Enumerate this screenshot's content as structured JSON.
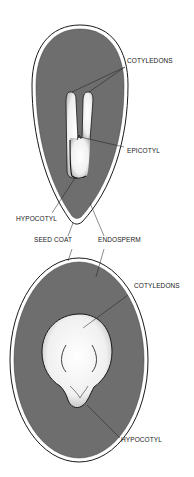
{
  "diagram": {
    "colors": {
      "endosperm": "#6e6e6e",
      "seed_coat": "#ffffff",
      "outline": "#1a1a1a",
      "embryo": "#f2f2f2",
      "background": "#ffffff"
    },
    "top_seed": {
      "labels": {
        "cotyledons": "COTYLEDONS",
        "epicotyl": "EPICOTYL",
        "hypocotyl": "HYPOCOTYL"
      }
    },
    "shared_labels": {
      "seed_coat": "SEED COAT",
      "endosperm": "ENDOSPERM"
    },
    "bottom_seed": {
      "labels": {
        "cotyledons": "COTYLEDONS",
        "hypocotyl": "HYPOCOTYL"
      }
    }
  }
}
